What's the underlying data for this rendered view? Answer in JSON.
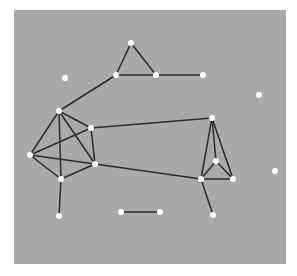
{
  "diagram": {
    "type": "network-graph",
    "colors": {
      "page_background": "#ffffff",
      "panel_background": "#a9a9a9",
      "edge": "#2b2b2b",
      "node": "#ffffff"
    },
    "panel": {
      "x": 14,
      "y": 10,
      "width": 272,
      "height": 254
    },
    "node_radius": 3,
    "edge_width": 1.5,
    "nodes": [
      {
        "id": "A",
        "x": 59,
        "y": 111
      },
      {
        "id": "B",
        "x": 91,
        "y": 128
      },
      {
        "id": "C",
        "x": 30,
        "y": 155
      },
      {
        "id": "D",
        "x": 95,
        "y": 164
      },
      {
        "id": "E",
        "x": 61,
        "y": 179
      },
      {
        "id": "F",
        "x": 131,
        "y": 43
      },
      {
        "id": "G",
        "x": 116,
        "y": 75
      },
      {
        "id": "H",
        "x": 156,
        "y": 75
      },
      {
        "id": "I",
        "x": 203,
        "y": 75
      },
      {
        "id": "J",
        "x": 212,
        "y": 118
      },
      {
        "id": "K",
        "x": 216,
        "y": 161
      },
      {
        "id": "L",
        "x": 201,
        "y": 179
      },
      {
        "id": "M",
        "x": 233,
        "y": 179
      },
      {
        "id": "N",
        "x": 213,
        "y": 215
      },
      {
        "id": "O",
        "x": 59,
        "y": 216
      },
      {
        "id": "P",
        "x": 121,
        "y": 212
      },
      {
        "id": "Q",
        "x": 160,
        "y": 212
      },
      {
        "id": "R",
        "x": 65,
        "y": 78
      },
      {
        "id": "S",
        "x": 259,
        "y": 95
      },
      {
        "id": "T",
        "x": 275,
        "y": 171
      }
    ],
    "edges": [
      [
        "A",
        "B"
      ],
      [
        "A",
        "C"
      ],
      [
        "A",
        "D"
      ],
      [
        "A",
        "E"
      ],
      [
        "B",
        "C"
      ],
      [
        "B",
        "D"
      ],
      [
        "C",
        "D"
      ],
      [
        "C",
        "E"
      ],
      [
        "D",
        "E"
      ],
      [
        "F",
        "G"
      ],
      [
        "F",
        "H"
      ],
      [
        "G",
        "H"
      ],
      [
        "H",
        "I"
      ],
      [
        "G",
        "A"
      ],
      [
        "J",
        "K"
      ],
      [
        "J",
        "L"
      ],
      [
        "J",
        "M"
      ],
      [
        "K",
        "L"
      ],
      [
        "K",
        "M"
      ],
      [
        "L",
        "M"
      ],
      [
        "L",
        "N"
      ],
      [
        "J",
        "B"
      ],
      [
        "L",
        "D"
      ],
      [
        "E",
        "O"
      ],
      [
        "P",
        "Q"
      ]
    ]
  }
}
